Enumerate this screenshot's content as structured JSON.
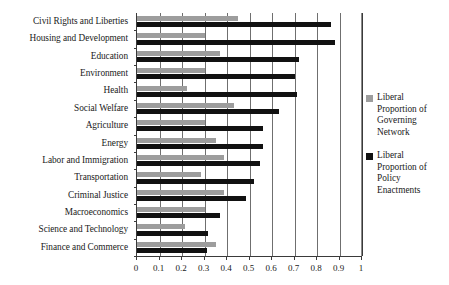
{
  "chart_data": {
    "type": "bar",
    "orientation": "horizontal",
    "title": "",
    "xlabel": "",
    "ylabel": "",
    "xlim": [
      0,
      1
    ],
    "xticks": [
      0,
      0.1,
      0.2,
      0.3,
      0.4,
      0.5,
      0.6,
      0.7,
      0.8,
      0.9,
      1
    ],
    "xtick_labels": [
      "0",
      "0.1",
      "0.2",
      "0.3",
      "0.4",
      "0.5",
      "0.6",
      "0.7",
      "0.8",
      "0.9",
      "1"
    ],
    "grid": true,
    "grid_axis": "x",
    "legend_position": "right",
    "categories": [
      "Civil Rights and Liberties",
      "Housing and Development",
      "Education",
      "Environment",
      "Health",
      "Social Welfare",
      "Agriculture",
      "Energy",
      "Labor and Immigration",
      "Transportation",
      "Criminal Justice",
      "Macroeconomics",
      "Science and Technology",
      "Finance and Commerce"
    ],
    "series": [
      {
        "name": "Liberal Proportion of Governing Network",
        "color": "#9d9d9d",
        "values": [
          0.45,
          0.3,
          0.37,
          0.3,
          0.22,
          0.43,
          0.3,
          0.35,
          0.385,
          0.285,
          0.385,
          0.3,
          0.215,
          0.35
        ]
      },
      {
        "name": "Liberal Proportion of Policy Enactments",
        "color": "#111111",
        "values": [
          0.86,
          0.88,
          0.72,
          0.7,
          0.71,
          0.63,
          0.56,
          0.56,
          0.545,
          0.52,
          0.485,
          0.37,
          0.315,
          0.31
        ]
      }
    ]
  },
  "legend": {
    "items": [
      {
        "label": "Liberal Proportion of Governing Network",
        "color": "#9d9d9d",
        "swatch": "gray-square-icon"
      },
      {
        "label": "Liberal Proportion of Policy Enactments",
        "color": "#111111",
        "swatch": "black-square-icon"
      }
    ]
  }
}
